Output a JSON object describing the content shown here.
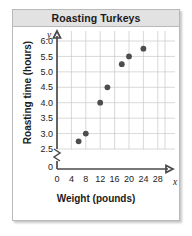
{
  "figure": {
    "title": "Roasting Turkeys"
  },
  "chart_data": {
    "type": "scatter",
    "title": "Roasting Turkeys",
    "xlabel": "Weight (pounds)",
    "ylabel": "Roasting time (hours)",
    "x_axis_variable": "x",
    "y_axis_variable": "y",
    "xlim": [
      0,
      30
    ],
    "ylim": [
      2.25,
      6.1
    ],
    "y_axis_break": true,
    "grid": true,
    "legend": null,
    "xticks": [
      "0",
      "4",
      "8",
      "12",
      "16",
      "20",
      "24",
      "28"
    ],
    "xtick_values": [
      0,
      4,
      8,
      12,
      16,
      20,
      24,
      28
    ],
    "yticks": [
      "0",
      "2.5",
      "3.0",
      "3.5",
      "4.0",
      "4.5",
      "5.0",
      "5.5",
      "6.0"
    ],
    "ytick_values": [
      0,
      2.5,
      3.0,
      3.5,
      4.0,
      4.5,
      5.0,
      5.5,
      6.0
    ],
    "points": [
      {
        "x": 6,
        "y": 2.75
      },
      {
        "x": 8,
        "y": 3.0
      },
      {
        "x": 12,
        "y": 4.0
      },
      {
        "x": 14,
        "y": 4.5
      },
      {
        "x": 18,
        "y": 5.25
      },
      {
        "x": 20,
        "y": 5.5
      },
      {
        "x": 24,
        "y": 5.75
      }
    ]
  },
  "colors": {
    "dot": "#4d4d4d",
    "grid": "#c8c8c8",
    "axis": "#4a4a4a",
    "title_bar": "#e2e2e2",
    "card_border": "#b9b9b9"
  }
}
